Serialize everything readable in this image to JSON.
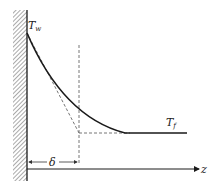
{
  "diagram": {
    "type": "boundary-layer temperature profile near wall",
    "labels": {
      "wall_temperature": "T",
      "wall_temperature_sub": "w",
      "fluid_temperature": "T",
      "fluid_temperature_sub": "f",
      "thickness": "δ",
      "axis": "z"
    },
    "colors": {
      "line": "#1a1a1a",
      "dashed": "#666666",
      "hatch": "#555555"
    }
  }
}
